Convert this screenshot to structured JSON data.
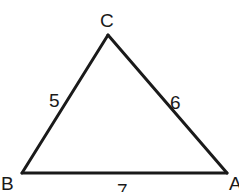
{
  "figure": {
    "type": "triangle",
    "vertices": [
      {
        "name": "C",
        "x": 108,
        "y": 35,
        "label_x": 100,
        "label_y": 27
      },
      {
        "name": "B",
        "x": 22,
        "y": 173,
        "label_x": 1,
        "label_y": 190
      },
      {
        "name": "A",
        "x": 227,
        "y": 173,
        "label_x": 229,
        "label_y": 190
      }
    ],
    "sides": [
      {
        "from": "B",
        "to": "C",
        "length_label": "5",
        "label_x": 49,
        "label_y": 107
      },
      {
        "from": "C",
        "to": "A",
        "length_label": "6",
        "label_x": 170,
        "label_y": 109
      },
      {
        "from": "B",
        "to": "A",
        "length_label": "7",
        "label_x": 117,
        "label_y": 197
      }
    ],
    "stroke_color": "#1a1a1a",
    "background": "#ffffff"
  }
}
